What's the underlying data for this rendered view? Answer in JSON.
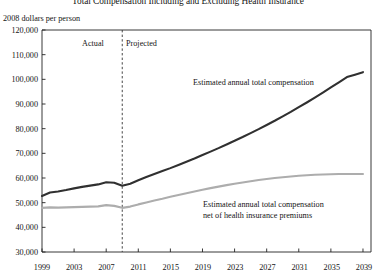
{
  "chart_data": {
    "type": "line",
    "title": "Total Compensation Including and Excluding Health Insurance",
    "ylabel": "2008 dollars per person",
    "xlabel": "",
    "ylim": [
      30000,
      120000
    ],
    "xlim": [
      1999,
      2040
    ],
    "yticks": [
      "120,000",
      "110,000",
      "100,000",
      "90,000",
      "80,000",
      "70,000",
      "60,000",
      "50,000",
      "40,000",
      "30,000"
    ],
    "ytick_values": [
      120000,
      110000,
      100000,
      90000,
      80000,
      70000,
      60000,
      50000,
      40000,
      30000
    ],
    "xticks": [
      "1999",
      "2003",
      "2007",
      "2011",
      "2015",
      "2019",
      "2023",
      "2027",
      "2031",
      "2035",
      "2039"
    ],
    "xtick_values": [
      1999,
      2003,
      2007,
      2011,
      2015,
      2019,
      2023,
      2027,
      2031,
      2035,
      2039
    ],
    "grid": false,
    "legend": "annotations",
    "divider": {
      "year": 2009,
      "left_label": "Actual",
      "right_label": "Projected",
      "style": "dashed"
    },
    "series": [
      {
        "name": "Estimated annual total compensation",
        "color": "#303030",
        "annotation": "Estimated annual total compensation",
        "x": [
          1999,
          2000,
          2001,
          2002,
          2003,
          2004,
          2005,
          2006,
          2007,
          2008,
          2009,
          2010,
          2011,
          2012,
          2013,
          2014,
          2015,
          2016,
          2017,
          2018,
          2019,
          2020,
          2021,
          2022,
          2023,
          2024,
          2025,
          2026,
          2027,
          2028,
          2029,
          2030,
          2031,
          2032,
          2033,
          2034,
          2035,
          2036,
          2037,
          2038,
          2039
        ],
        "values": [
          52700,
          54100,
          54500,
          55100,
          55800,
          56400,
          56900,
          57400,
          58300,
          58100,
          56900,
          57700,
          59100,
          60400,
          61600,
          62800,
          64000,
          65300,
          66600,
          67900,
          69300,
          70700,
          72100,
          73600,
          75100,
          76600,
          78200,
          79800,
          81500,
          83200,
          85000,
          86800,
          88700,
          90600,
          92600,
          94600,
          96700,
          98800,
          100900,
          101900,
          102900
        ]
      },
      {
        "name": "Estimated annual total compensation net of health insurance premiums",
        "color": "#adadad",
        "annotation": "Estimated annual total compensation\nnet of health insurance premiums",
        "annotation_line1": "Estimated annual total compensation",
        "annotation_line2": "net of health insurance premiums",
        "x": [
          1999,
          2000,
          2001,
          2002,
          2003,
          2004,
          2005,
          2006,
          2007,
          2008,
          2009,
          2010,
          2011,
          2012,
          2013,
          2014,
          2015,
          2016,
          2017,
          2018,
          2019,
          2020,
          2021,
          2022,
          2023,
          2024,
          2025,
          2026,
          2027,
          2028,
          2029,
          2030,
          2031,
          2032,
          2033,
          2034,
          2035,
          2036,
          2037,
          2038,
          2039
        ],
        "values": [
          47900,
          48100,
          48000,
          48100,
          48200,
          48300,
          48400,
          48500,
          49000,
          48700,
          47900,
          48400,
          49300,
          50100,
          50900,
          51600,
          52400,
          53100,
          53800,
          54500,
          55200,
          55900,
          56500,
          57100,
          57700,
          58200,
          58700,
          59200,
          59600,
          60000,
          60300,
          60600,
          60900,
          61100,
          61300,
          61400,
          61500,
          61600,
          61600,
          61600,
          61600
        ]
      }
    ]
  }
}
